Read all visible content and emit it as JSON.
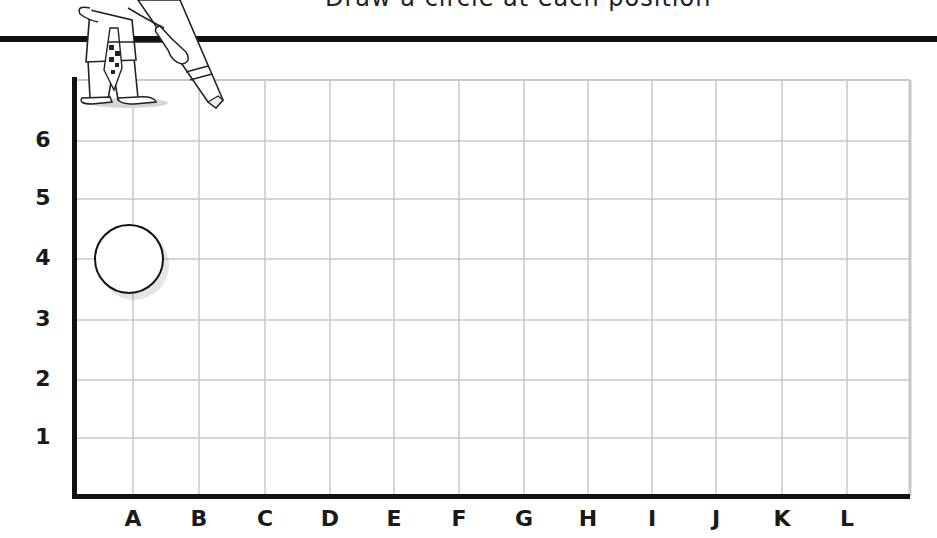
{
  "header": {
    "title_partial": "Draw a circle at each position"
  },
  "grid": {
    "columns": [
      "A",
      "B",
      "C",
      "D",
      "E",
      "F",
      "G",
      "H",
      "I",
      "J",
      "K",
      "L"
    ],
    "rows": [
      "6",
      "5",
      "4",
      "3",
      "2",
      "1"
    ],
    "col_positions_px": [
      133,
      199,
      265,
      330,
      394,
      459,
      524,
      588,
      652,
      716,
      782,
      847
    ],
    "row_positions_px": [
      141,
      199,
      259,
      320,
      380,
      438
    ],
    "grid_line_color": "#c8c8c8",
    "axis_color": "#111111"
  },
  "markers": [
    {
      "shape": "circle",
      "column": "A",
      "row": "4",
      "label": "circle-at-A4"
    }
  ],
  "illustration": {
    "description": "cartoon boy holding a giant pencil"
  },
  "chart_data": {
    "type": "scatter",
    "title": "",
    "xlabel": "",
    "ylabel": "",
    "x_categories": [
      "A",
      "B",
      "C",
      "D",
      "E",
      "F",
      "G",
      "H",
      "I",
      "J",
      "K",
      "L"
    ],
    "y_categories": [
      "1",
      "2",
      "3",
      "4",
      "5",
      "6"
    ],
    "points": [
      {
        "x": "A",
        "y": "4",
        "marker": "open circle"
      }
    ],
    "grid": true
  }
}
